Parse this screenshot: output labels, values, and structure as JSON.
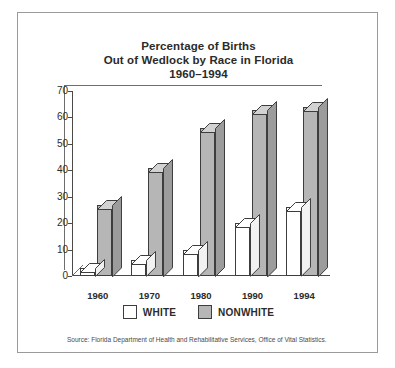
{
  "chart_data": {
    "type": "bar",
    "title": "Percentage of Births Out of Wedlock by Race in Florida 1960–1994",
    "title_lines": [
      "Percentage of Births",
      "Out of Wedlock by Race in Florida",
      "1960–1994"
    ],
    "categories": [
      "1960",
      "1970",
      "1980",
      "1990",
      "1994"
    ],
    "series": [
      {
        "name": "WHITE",
        "values": [
          3,
          6,
          10,
          20,
          26
        ],
        "color": "#ffffff"
      },
      {
        "name": "NONWHITE",
        "values": [
          27,
          41,
          56,
          63,
          64
        ],
        "color": "#b6b6b6"
      }
    ],
    "xlabel": "",
    "ylabel": "",
    "ylim": [
      0,
      70
    ],
    "yticks": [
      0,
      10,
      20,
      30,
      40,
      50,
      60,
      70
    ],
    "grid": false,
    "legend_position": "bottom",
    "style": "3d-bar"
  },
  "legend": {
    "items": [
      {
        "label": "WHITE",
        "swatch": "white"
      },
      {
        "label": "NONWHITE",
        "swatch": "nonwhite"
      }
    ]
  },
  "source": {
    "text": "Source: Florida Department of Health and Rehabilitative Services, Office of Vital Statistics."
  },
  "colors": {
    "nonwhite_fill": "#b6b6b6",
    "nonwhite_top": "#d2d2d2",
    "nonwhite_side": "#9c9c9c",
    "white_fill": "#ffffff",
    "outline": "#3d3d3d",
    "axis": "#4a4a4a",
    "frame": "#9a9a9a",
    "text": "#2b2b2b"
  }
}
